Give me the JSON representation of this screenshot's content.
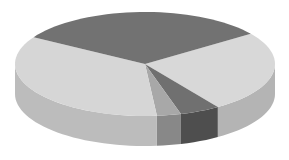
{
  "chart_data": {
    "type": "pie",
    "style": "3d-grayscale",
    "title": "",
    "legend": [],
    "labels": [
      "Slice A",
      "Slice B",
      "Slice C",
      "Slice D",
      "Slice E"
    ],
    "values": [
      25.4,
      5.0,
      3.0,
      35.1,
      31.5
    ],
    "start_angle_deg": 324.5,
    "direction": "clockwise",
    "colors": {
      "top": [
        "#d8d8d8",
        "#707070",
        "#a8a8a8",
        "#d6d6d6",
        "#727272"
      ],
      "side": [
        "#b4b4b4",
        "#4e4e4e",
        "#888888",
        "#bcbcbc",
        "#555555"
      ]
    },
    "geometry": {
      "cx": 145,
      "cy": 64,
      "rx": 130,
      "ry": 52,
      "depth": 30
    }
  }
}
